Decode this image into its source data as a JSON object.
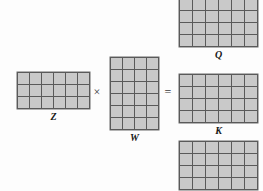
{
  "figure": {
    "type": "matrix-multiplication-diagram",
    "colors": {
      "cell_fill": "#c9c9c9",
      "grid_line": "#5a5a5a",
      "background": "#fdfdfd",
      "label_text": "#161616",
      "operator_text": "#3a3a3a"
    }
  },
  "operators": {
    "multiply": "×",
    "equals": "="
  },
  "matrices": [
    {
      "id": "z",
      "label": "Z",
      "rows": 3,
      "cols": 6,
      "cell_w": 11,
      "cell_h": 11,
      "label_position": "below"
    },
    {
      "id": "w",
      "label": "W",
      "rows": 6,
      "cols": 4,
      "cell_w": 11,
      "cell_h": 11,
      "label_position": "below"
    },
    {
      "id": "q",
      "label": "Q",
      "rows": 4,
      "cols": 6,
      "cell_w": 12,
      "cell_h": 11,
      "label_position": "below"
    },
    {
      "id": "k",
      "label": "K",
      "rows": 4,
      "cols": 6,
      "cell_w": 12,
      "cell_h": 11,
      "label_position": "below"
    },
    {
      "id": "v",
      "label": "V",
      "rows": 4,
      "cols": 6,
      "cell_w": 12,
      "cell_h": 11,
      "label_position": "below"
    }
  ]
}
